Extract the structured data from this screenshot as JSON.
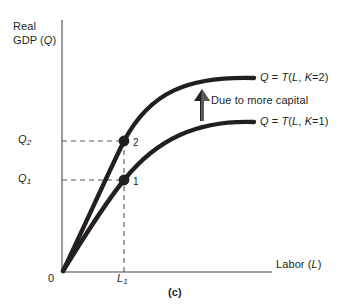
{
  "figure": {
    "caption": "(c)",
    "type": "line-diagram"
  },
  "axes": {
    "y_title_line1": "Real",
    "y_title_line2_prefix": "GDP (",
    "y_title_var": "Q",
    "y_title_suffix": ")",
    "x_title_prefix": "Labor (",
    "x_title_var": "L",
    "x_title_suffix": ")",
    "origin_label": "0"
  },
  "ticks": {
    "x": [
      {
        "name": "L1",
        "base": "L",
        "sub": "1"
      }
    ],
    "y": [
      {
        "name": "Q1",
        "base": "Q",
        "sub": "1"
      },
      {
        "name": "Q2",
        "base": "Q",
        "sub": "2"
      }
    ]
  },
  "curves": [
    {
      "id": "capital-2",
      "label_prefix": "Q",
      "label_eq": " = ",
      "label_fn": "T",
      "label_args_open": "(",
      "label_arg1": "L",
      "label_comma": ", ",
      "label_arg2": "K",
      "label_arg2_value": "=2)",
      "capital": 2
    },
    {
      "id": "capital-1",
      "label_prefix": "Q",
      "label_eq": " = ",
      "label_fn": "T",
      "label_args_open": "(",
      "label_arg1": "L",
      "label_comma": ", ",
      "label_arg2": "K",
      "label_arg2_value": "=1)",
      "capital": 1
    }
  ],
  "annotation": {
    "shift_note": "Due to more capital"
  },
  "points": [
    {
      "id": "point-1",
      "label": "1",
      "x_tick": "L1",
      "y_tick": "Q1"
    },
    {
      "id": "point-2",
      "label": "2",
      "x_tick": "L1",
      "y_tick": "Q2"
    }
  ],
  "colors": {
    "curve": "#231f20",
    "axis": "#808285",
    "text": "#231f20",
    "dashed_guide": "#58595b",
    "arrow": "#231f20",
    "background": "#ffffff"
  }
}
